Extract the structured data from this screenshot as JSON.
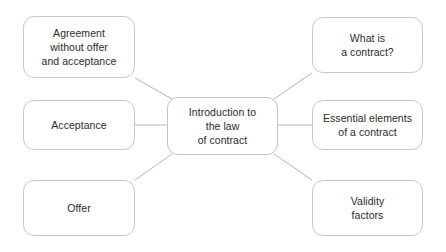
{
  "diagram": {
    "type": "mind-map",
    "title_node": {
      "id": "center",
      "label": "Introduction to\nthe law\nof contract"
    },
    "branches": [
      {
        "id": "agreement-without-offer-and-acceptance",
        "label": "Agreement\nwithout offer\nand acceptance",
        "side": "left",
        "position": "top"
      },
      {
        "id": "acceptance",
        "label": "Acceptance",
        "side": "left",
        "position": "middle"
      },
      {
        "id": "offer",
        "label": "Offer",
        "side": "left",
        "position": "bottom"
      },
      {
        "id": "what-is-a-contract",
        "label": "What is\na contract?",
        "side": "right",
        "position": "top"
      },
      {
        "id": "essential-elements-of-a-contract",
        "label": "Essential elements\nof a contract",
        "side": "right",
        "position": "middle"
      },
      {
        "id": "validity-factors",
        "label": "Validity\nfactors",
        "side": "right",
        "position": "bottom"
      }
    ],
    "colors": {
      "background": "#ffffff",
      "node_fill": "#ffffff",
      "node_border": "#c9c9c9",
      "connector": "#b4b4b4",
      "text": "#2b2b2b"
    }
  }
}
